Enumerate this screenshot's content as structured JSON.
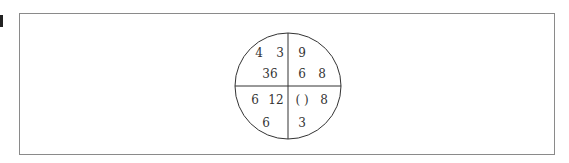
{
  "puzzle": {
    "type": "number-circle-quadrants",
    "quadrants": {
      "top_left": {
        "a": "4",
        "b": "3",
        "c": "36"
      },
      "top_right": {
        "a": "9",
        "b": "6",
        "c": "8"
      },
      "bottom_left": {
        "a": "6",
        "b": "12",
        "c": "6"
      },
      "bottom_right": {
        "a": "( )",
        "b": "8",
        "c": "3"
      }
    }
  }
}
